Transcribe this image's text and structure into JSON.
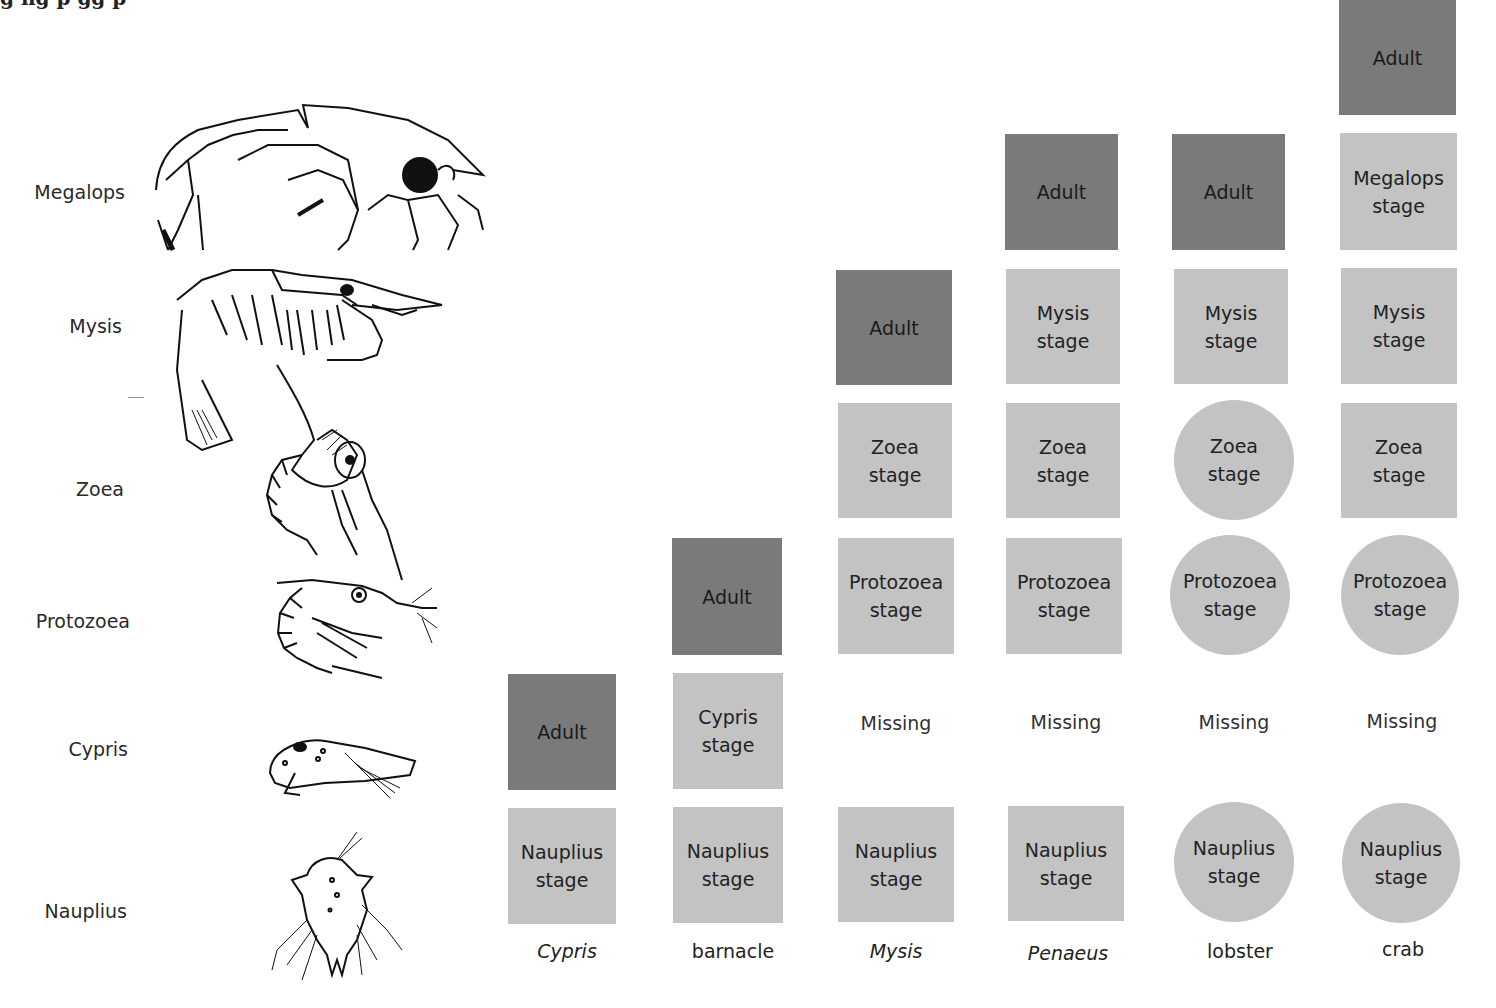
{
  "caption_fragment": "g      ng p                    gg p",
  "row_labels": [
    {
      "label": "Megalops",
      "y": 181
    },
    {
      "label": "Mysis",
      "y": 315
    },
    {
      "label": "Zoea",
      "y": 478
    },
    {
      "label": "Protozoea",
      "y": 610
    },
    {
      "label": "Cypris",
      "y": 738
    },
    {
      "label": "Nauplius",
      "y": 900
    }
  ],
  "drawings": [
    {
      "name": "megalops-larva"
    },
    {
      "name": "mysis-larva"
    },
    {
      "name": "zoea-larva"
    },
    {
      "name": "protozoea-larva"
    },
    {
      "name": "cypris-larva"
    },
    {
      "name": "nauplius-larva"
    }
  ],
  "colors": {
    "stage_light": "#c3c3c3",
    "stage_adult": "#7a7a7a",
    "text": "#222222"
  },
  "columns": [
    {
      "species": "Cypris",
      "italic": true,
      "stages": [
        {
          "line1": "Nauplius",
          "line2": "stage",
          "shape": "square",
          "tone": "light"
        },
        {
          "line1": "Adult",
          "line2": "",
          "shape": "square",
          "tone": "dark"
        }
      ]
    },
    {
      "species": "barnacle",
      "italic": false,
      "stages": [
        {
          "line1": "Nauplius",
          "line2": "stage",
          "shape": "square",
          "tone": "light"
        },
        {
          "line1": "Cypris",
          "line2": "stage",
          "shape": "square",
          "tone": "light"
        },
        {
          "line1": "Adult",
          "line2": "",
          "shape": "square",
          "tone": "dark"
        }
      ]
    },
    {
      "species": "Mysis",
      "italic": true,
      "missing": "Missing",
      "stages": [
        {
          "line1": "Nauplius",
          "line2": "stage",
          "shape": "square",
          "tone": "light"
        },
        {
          "line1": "Protozoea",
          "line2": "stage",
          "shape": "square",
          "tone": "light"
        },
        {
          "line1": "Zoea",
          "line2": "stage",
          "shape": "square",
          "tone": "light"
        },
        {
          "line1": "Adult",
          "line2": "",
          "shape": "square",
          "tone": "dark"
        }
      ]
    },
    {
      "species": "Penaeus",
      "italic": true,
      "missing": "Missing",
      "stages": [
        {
          "line1": "Nauplius",
          "line2": "stage",
          "shape": "square",
          "tone": "light"
        },
        {
          "line1": "Protozoea",
          "line2": "stage",
          "shape": "square",
          "tone": "light"
        },
        {
          "line1": "Zoea",
          "line2": "stage",
          "shape": "square",
          "tone": "light"
        },
        {
          "line1": "Mysis",
          "line2": "stage",
          "shape": "square",
          "tone": "light"
        },
        {
          "line1": "Adult",
          "line2": "",
          "shape": "square",
          "tone": "dark"
        }
      ]
    },
    {
      "species": "lobster",
      "italic": false,
      "missing": "Missing",
      "stages": [
        {
          "line1": "Nauplius",
          "line2": "stage",
          "shape": "circle",
          "tone": "light"
        },
        {
          "line1": "Protozoea",
          "line2": "stage",
          "shape": "circle",
          "tone": "light"
        },
        {
          "line1": "Zoea",
          "line2": "stage",
          "shape": "circle",
          "tone": "light"
        },
        {
          "line1": "Mysis",
          "line2": "stage",
          "shape": "square",
          "tone": "light"
        },
        {
          "line1": "Adult",
          "line2": "",
          "shape": "square",
          "tone": "dark"
        }
      ]
    },
    {
      "species": "crab",
      "italic": false,
      "missing": "Missing",
      "stages": [
        {
          "line1": "Nauplius",
          "line2": "stage",
          "shape": "circle",
          "tone": "light"
        },
        {
          "line1": "Protozoea",
          "line2": "stage",
          "shape": "circle",
          "tone": "light"
        },
        {
          "line1": "Zoea",
          "line2": "stage",
          "shape": "square",
          "tone": "light"
        },
        {
          "line1": "Mysis",
          "line2": "stage",
          "shape": "square",
          "tone": "light"
        },
        {
          "line1": "Megalops",
          "line2": "stage",
          "shape": "square",
          "tone": "light"
        },
        {
          "line1": "Adult",
          "line2": "",
          "shape": "square",
          "tone": "dark"
        }
      ]
    }
  ]
}
